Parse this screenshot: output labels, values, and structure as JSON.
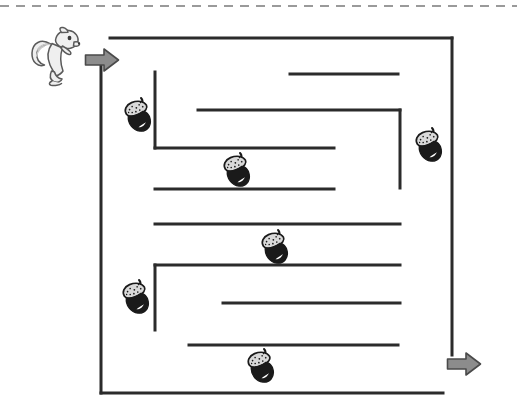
{
  "page": {
    "title": "Squirrel and Acorns Maze",
    "width": 517,
    "height": 410,
    "background_color": "#ffffff"
  },
  "colors": {
    "wall": "#2b2b2b",
    "border_dash": "#9a9a9a",
    "arrow_fill": "#8c8c8c",
    "arrow_stroke": "#4a4a4a",
    "acorn_cap": "#d9d9d9",
    "acorn_cap_stroke": "#1a1a1a",
    "acorn_body": "#1a1a1a",
    "acorn_highlight": "#ffffff",
    "squirrel_fill": "#efefef",
    "squirrel_shade": "#c9c9c9",
    "squirrel_stroke": "#5a5a5a"
  },
  "cut_line": {
    "name": "dashed-cut-line",
    "y": 6,
    "x_start": 0,
    "x_end": 517,
    "dash_pattern": "9 7",
    "stroke_width": 2
  },
  "characters": {
    "squirrel": {
      "label": "squirrel",
      "x": 30,
      "y": 26,
      "width": 52,
      "height": 62
    }
  },
  "arrows": [
    {
      "name": "entrance-arrow",
      "label": "entrance",
      "x": 84,
      "y": 47,
      "width": 36,
      "height": 26,
      "direction": "right"
    },
    {
      "name": "exit-arrow",
      "label": "exit",
      "x": 446,
      "y": 351,
      "width": 36,
      "height": 26,
      "direction": "right"
    }
  ],
  "maze": {
    "bounds": {
      "left": 101,
      "top": 38,
      "right": 452,
      "bottom": 393
    },
    "wall_width": 3,
    "entrance": {
      "x": 101,
      "y": 52,
      "side": "left"
    },
    "exit": {
      "x": 452,
      "y": 364,
      "side": "right"
    },
    "walls": [
      {
        "name": "wall-border-top",
        "x1": 110,
        "y1": 38,
        "x2": 452,
        "y2": 38
      },
      {
        "name": "wall-border-right",
        "x1": 452,
        "y1": 38,
        "x2": 452,
        "y2": 355
      },
      {
        "name": "wall-border-left",
        "x1": 101,
        "y1": 62,
        "x2": 101,
        "y2": 393
      },
      {
        "name": "wall-border-bottom",
        "x1": 101,
        "y1": 393,
        "x2": 443,
        "y2": 393
      },
      {
        "name": "wall-top-stub",
        "x1": 290,
        "y1": 74,
        "x2": 398,
        "y2": 74
      },
      {
        "name": "wall-inner-vert-upper",
        "x1": 155,
        "y1": 72,
        "x2": 155,
        "y2": 148
      },
      {
        "name": "wall-inner-horiz-a",
        "x1": 155,
        "y1": 148,
        "x2": 334,
        "y2": 148
      },
      {
        "name": "wall-inner-horiz-b",
        "x1": 198,
        "y1": 110,
        "x2": 400,
        "y2": 110
      },
      {
        "name": "wall-inner-vert-right",
        "x1": 400,
        "y1": 110,
        "x2": 400,
        "y2": 188
      },
      {
        "name": "wall-inner-horiz-c",
        "x1": 155,
        "y1": 189,
        "x2": 334,
        "y2": 189
      },
      {
        "name": "wall-inner-horiz-d",
        "x1": 155,
        "y1": 224,
        "x2": 400,
        "y2": 224
      },
      {
        "name": "wall-inner-horiz-e",
        "x1": 155,
        "y1": 265,
        "x2": 400,
        "y2": 265
      },
      {
        "name": "wall-inner-vert-lower",
        "x1": 155,
        "y1": 265,
        "x2": 155,
        "y2": 330
      },
      {
        "name": "wall-inner-horiz-f",
        "x1": 223,
        "y1": 303,
        "x2": 400,
        "y2": 303
      },
      {
        "name": "wall-inner-horiz-g",
        "x1": 189,
        "y1": 345,
        "x2": 398,
        "y2": 345
      }
    ]
  },
  "acorns": [
    {
      "name": "acorn-1",
      "label": "acorn",
      "x": 122,
      "y": 96,
      "width": 34,
      "height": 40,
      "rotation": -18
    },
    {
      "name": "acorn-2",
      "label": "acorn",
      "x": 221,
      "y": 151,
      "width": 34,
      "height": 40,
      "rotation": -18
    },
    {
      "name": "acorn-3",
      "label": "acorn",
      "x": 413,
      "y": 126,
      "width": 34,
      "height": 40,
      "rotation": -18
    },
    {
      "name": "acorn-4",
      "label": "acorn",
      "x": 259,
      "y": 228,
      "width": 34,
      "height": 40,
      "rotation": -18
    },
    {
      "name": "acorn-5",
      "label": "acorn",
      "x": 120,
      "y": 278,
      "width": 34,
      "height": 40,
      "rotation": -18
    },
    {
      "name": "acorn-6",
      "label": "acorn",
      "x": 245,
      "y": 347,
      "width": 34,
      "height": 40,
      "rotation": -18
    }
  ],
  "counts": {
    "acorn_count": 6,
    "arrow_count": 2,
    "wall_count": 15
  }
}
